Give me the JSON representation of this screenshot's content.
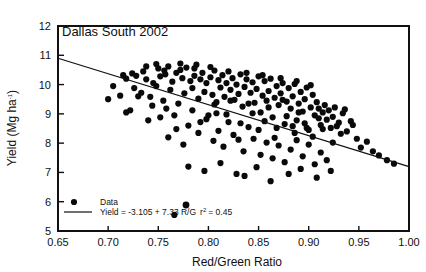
{
  "chart_data": {
    "type": "scatter",
    "title": "Dallas South 2002",
    "xlabel": "Red/Green Ratio",
    "ylabel": "Yield (Mg ha-1)",
    "ylabel_base": "Yield (Mg ha",
    "ylabel_sup": "-1",
    "ylabel_tail": ")",
    "xlim": [
      0.65,
      1.0
    ],
    "ylim": [
      5,
      12
    ],
    "grid": false,
    "xticks": [
      "0.65",
      "0.70",
      "0.75",
      "0.80",
      "0.85",
      "0.90",
      "0.95",
      "1.00"
    ],
    "xtick_values": [
      0.65,
      0.7,
      0.75,
      0.8,
      0.85,
      0.9,
      0.95,
      1.0
    ],
    "yticks": [
      "5",
      "6",
      "7",
      "8",
      "9",
      "10",
      "11",
      "12"
    ],
    "ytick_values": [
      5,
      6,
      7,
      8,
      9,
      10,
      11,
      12
    ],
    "legend_position": "lower-left-inside",
    "series": [
      {
        "name": "Data",
        "marker": "filled-circle",
        "color": "#0a0a0a",
        "points": [
          [
            0.7,
            9.5
          ],
          [
            0.705,
            9.95
          ],
          [
            0.712,
            9.62
          ],
          [
            0.715,
            10.32
          ],
          [
            0.718,
            10.2
          ],
          [
            0.722,
            9.12
          ],
          [
            0.724,
            10.38
          ],
          [
            0.728,
            10.3
          ],
          [
            0.73,
            9.6
          ],
          [
            0.733,
            9.72
          ],
          [
            0.735,
            10.45
          ],
          [
            0.738,
            10.18
          ],
          [
            0.74,
            8.78
          ],
          [
            0.742,
            9.58
          ],
          [
            0.745,
            10.05
          ],
          [
            0.748,
            9.95
          ],
          [
            0.75,
            10.55
          ],
          [
            0.752,
            10.28
          ],
          [
            0.755,
            9.45
          ],
          [
            0.757,
            10.35
          ],
          [
            0.76,
            10.62
          ],
          [
            0.762,
            9.82
          ],
          [
            0.764,
            10.1
          ],
          [
            0.766,
            5.55
          ],
          [
            0.768,
            10.4
          ],
          [
            0.77,
            9.35
          ],
          [
            0.772,
            10.5
          ],
          [
            0.774,
            10.22
          ],
          [
            0.776,
            9.7
          ],
          [
            0.778,
            10.58
          ],
          [
            0.78,
            8.6
          ],
          [
            0.782,
            10.12
          ],
          [
            0.784,
            9.88
          ],
          [
            0.786,
            10.3
          ],
          [
            0.788,
            10.68
          ],
          [
            0.79,
            9.52
          ],
          [
            0.792,
            10.18
          ],
          [
            0.794,
            10.4
          ],
          [
            0.796,
            9.75
          ],
          [
            0.798,
            10.05
          ],
          [
            0.8,
            8.95
          ],
          [
            0.802,
            10.25
          ],
          [
            0.804,
            9.65
          ],
          [
            0.806,
            10.48
          ],
          [
            0.808,
            9.4
          ],
          [
            0.81,
            10.15
          ],
          [
            0.812,
            9.9
          ],
          [
            0.814,
            10.32
          ],
          [
            0.816,
            9.58
          ],
          [
            0.818,
            10.05
          ],
          [
            0.82,
            8.72
          ],
          [
            0.822,
            9.82
          ],
          [
            0.824,
            10.22
          ],
          [
            0.826,
            9.48
          ],
          [
            0.828,
            10.0
          ],
          [
            0.83,
            9.68
          ],
          [
            0.832,
            10.35
          ],
          [
            0.834,
            9.25
          ],
          [
            0.836,
            9.92
          ],
          [
            0.838,
            10.18
          ],
          [
            0.84,
            8.55
          ],
          [
            0.842,
            9.72
          ],
          [
            0.844,
            10.08
          ],
          [
            0.846,
            9.38
          ],
          [
            0.848,
            9.85
          ],
          [
            0.85,
            10.28
          ],
          [
            0.852,
            9.05
          ],
          [
            0.854,
            9.62
          ],
          [
            0.856,
            10.12
          ],
          [
            0.858,
            9.45
          ],
          [
            0.86,
            9.78
          ],
          [
            0.862,
            10.2
          ],
          [
            0.864,
            8.88
          ],
          [
            0.866,
            9.55
          ],
          [
            0.868,
            9.95
          ],
          [
            0.87,
            9.3
          ],
          [
            0.872,
            9.7
          ],
          [
            0.874,
            10.05
          ],
          [
            0.876,
            8.65
          ],
          [
            0.878,
            9.42
          ],
          [
            0.88,
            9.88
          ],
          [
            0.882,
            9.18
          ],
          [
            0.884,
            9.6
          ],
          [
            0.886,
            10.02
          ],
          [
            0.888,
            8.78
          ],
          [
            0.89,
            9.35
          ],
          [
            0.892,
            9.75
          ],
          [
            0.894,
            9.08
          ],
          [
            0.896,
            9.5
          ],
          [
            0.898,
            9.9
          ],
          [
            0.9,
            8.45
          ],
          [
            0.902,
            9.22
          ],
          [
            0.904,
            9.65
          ],
          [
            0.906,
            8.95
          ],
          [
            0.908,
            9.4
          ],
          [
            0.91,
            9.18
          ],
          [
            0.912,
            8.62
          ],
          [
            0.914,
            9.05
          ],
          [
            0.916,
            9.3
          ],
          [
            0.918,
            8.8
          ],
          [
            0.92,
            9.12
          ],
          [
            0.922,
            8.52
          ],
          [
            0.924,
            8.9
          ],
          [
            0.926,
            9.22
          ],
          [
            0.93,
            8.7
          ],
          [
            0.934,
            9.02
          ],
          [
            0.938,
            8.4
          ],
          [
            0.942,
            8.75
          ],
          [
            0.948,
            8.15
          ],
          [
            0.952,
            7.85
          ],
          [
            0.958,
            8.05
          ],
          [
            0.964,
            7.72
          ],
          [
            0.97,
            7.58
          ],
          [
            0.978,
            7.42
          ],
          [
            0.985,
            7.3
          ],
          [
            0.76,
            8.2
          ],
          [
            0.775,
            7.95
          ],
          [
            0.79,
            8.35
          ],
          [
            0.805,
            8.08
          ],
          [
            0.815,
            7.88
          ],
          [
            0.825,
            8.28
          ],
          [
            0.835,
            7.72
          ],
          [
            0.845,
            8.15
          ],
          [
            0.852,
            7.6
          ],
          [
            0.858,
            8.02
          ],
          [
            0.864,
            7.48
          ],
          [
            0.87,
            7.92
          ],
          [
            0.876,
            7.35
          ],
          [
            0.882,
            7.78
          ],
          [
            0.888,
            8.1
          ],
          [
            0.894,
            7.55
          ],
          [
            0.9,
            7.95
          ],
          [
            0.906,
            7.28
          ],
          [
            0.912,
            7.68
          ],
          [
            0.918,
            7.42
          ],
          [
            0.88,
            6.95
          ],
          [
            0.892,
            7.12
          ],
          [
            0.908,
            6.82
          ],
          [
            0.922,
            7.05
          ],
          [
            0.836,
            6.88
          ],
          [
            0.848,
            7.18
          ],
          [
            0.862,
            6.7
          ],
          [
            0.78,
            7.2
          ],
          [
            0.796,
            7.05
          ],
          [
            0.812,
            7.32
          ],
          [
            0.828,
            6.95
          ],
          [
            0.718,
            9.05
          ],
          [
            0.726,
            9.88
          ],
          [
            0.744,
            9.28
          ],
          [
            0.758,
            9.18
          ],
          [
            0.766,
            8.95
          ],
          [
            0.784,
            9.12
          ],
          [
            0.798,
            8.82
          ],
          [
            0.806,
            9.32
          ],
          [
            0.818,
            8.98
          ],
          [
            0.832,
            8.68
          ],
          [
            0.844,
            9.02
          ],
          [
            0.856,
            8.75
          ],
          [
            0.868,
            8.52
          ],
          [
            0.878,
            8.92
          ],
          [
            0.886,
            8.35
          ],
          [
            0.896,
            8.68
          ],
          [
            0.904,
            8.22
          ],
          [
            0.914,
            8.48
          ],
          [
            0.924,
            8.02
          ],
          [
            0.932,
            8.32
          ],
          [
            0.738,
            10.62
          ],
          [
            0.748,
            10.7
          ],
          [
            0.756,
            10.48
          ],
          [
            0.772,
            10.72
          ],
          [
            0.786,
            10.55
          ],
          [
            0.802,
            10.6
          ],
          [
            0.82,
            10.45
          ],
          [
            0.838,
            10.4
          ],
          [
            0.854,
            10.32
          ],
          [
            0.872,
            10.22
          ],
          [
            0.888,
            10.12
          ],
          [
            0.902,
            9.98
          ],
          [
            0.808,
            9.02
          ],
          [
            0.822,
            9.45
          ],
          [
            0.84,
            9.35
          ],
          [
            0.86,
            9.22
          ],
          [
            0.874,
            9.48
          ],
          [
            0.89,
            9.05
          ],
          [
            0.898,
            8.52
          ],
          [
            0.91,
            8.85
          ],
          [
            0.928,
            8.58
          ],
          [
            0.936,
            9.15
          ],
          [
            0.944,
            8.62
          ],
          [
            0.752,
            8.88
          ],
          [
            0.768,
            8.48
          ],
          [
            0.792,
            8.72
          ],
          [
            0.81,
            8.42
          ],
          [
            0.83,
            8.12
          ],
          [
            0.85,
            8.45
          ],
          [
            0.866,
            8.18
          ],
          [
            0.884,
            8.58
          ]
        ]
      }
    ],
    "fit_line": {
      "label_prefix": "Yield = -3.105 + 7.3",
      "label_occluded_digit": "?",
      "label_suffix": "3 R/G",
      "r_squared_symbol": "r",
      "r_squared_sup": "2",
      "r_squared_text": "= 0.45",
      "full_label": "Yield = -3.105 + 7.3?3 R/G  r2 = 0.45",
      "intercept": -3.105,
      "slope": 7.3,
      "r_squared": 0.45,
      "x_start": 0.65,
      "y_start": 10.9,
      "x_end": 1.0,
      "y_end": 7.2
    },
    "legend": [
      {
        "label": "Data",
        "marker": "filled-circle"
      },
      {
        "label": "fit-equation",
        "marker": "line"
      }
    ]
  }
}
